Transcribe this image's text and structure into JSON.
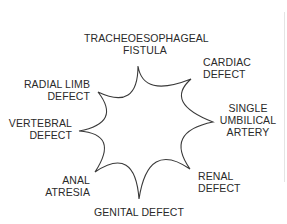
{
  "diagram": {
    "title": "",
    "center_shape": "eight-pointed concave star",
    "stroke_color": "#3a3a3a",
    "text_color": "#2a2a2a",
    "labels": [
      {
        "id": "tracheoesophageal-fistula",
        "lines": [
          "TRACHEOESOPHAGEAL",
          "FISTULA"
        ]
      },
      {
        "id": "cardiac-defect",
        "lines": [
          "CARDIAC",
          "DEFECT"
        ]
      },
      {
        "id": "single-umbilical-artery",
        "lines": [
          "SINGLE",
          "UMBILICAL",
          "ARTERY"
        ]
      },
      {
        "id": "renal-defect",
        "lines": [
          "RENAL",
          "DEFECT"
        ]
      },
      {
        "id": "genital-defect",
        "lines": [
          "GENITAL DEFECT"
        ]
      },
      {
        "id": "anal-atresia",
        "lines": [
          "ANAL",
          "ATRESIA"
        ]
      },
      {
        "id": "vertebral-defect",
        "lines": [
          "VERTEBRAL",
          "DEFECT"
        ]
      },
      {
        "id": "radial-limb-defect",
        "lines": [
          "RADIAL LIMB",
          "DEFECT"
        ]
      }
    ]
  }
}
